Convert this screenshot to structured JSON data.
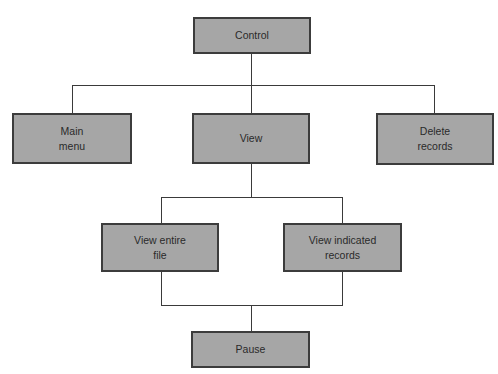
{
  "diagram": {
    "type": "hierarchy-chart",
    "colors": {
      "node_fill": "#a6a6a6",
      "node_border": "#3c3c3c",
      "connector": "#3a3a3a",
      "text": "#2a2a2a",
      "background": "#ffffff"
    },
    "nodes": {
      "control": {
        "label": "Control"
      },
      "main_menu": {
        "label": "Main\nmenu"
      },
      "view": {
        "label": "View"
      },
      "delete_records": {
        "label": "Delete\nrecords"
      },
      "view_entire_file": {
        "label": "View entire\nfile"
      },
      "view_indicated_records": {
        "label": "View indicated\nrecords"
      },
      "pause": {
        "label": "Pause"
      }
    },
    "edges": [
      {
        "from": "Control",
        "to": "Main menu"
      },
      {
        "from": "Control",
        "to": "View"
      },
      {
        "from": "Control",
        "to": "Delete records"
      },
      {
        "from": "View",
        "to": "View entire file"
      },
      {
        "from": "View",
        "to": "View indicated records"
      },
      {
        "from": "View entire file",
        "to": "Pause"
      },
      {
        "from": "View indicated records",
        "to": "Pause"
      }
    ]
  }
}
